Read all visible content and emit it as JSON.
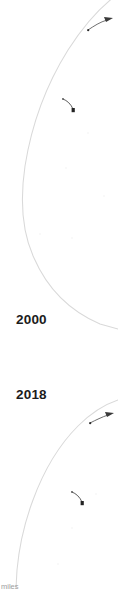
{
  "figure": {
    "kind": "map-panel-strip",
    "background_color": "#ffffff",
    "coastline_color": "#d8d8d8",
    "annotation_color": "#2b2b2b",
    "label_color": "#1c1c1c"
  },
  "panels": [
    {
      "year_label": "2000",
      "curve_name": "shoreline-arc-2000",
      "annotations": [
        {
          "name": "annotation-mark-upper-right",
          "label": ""
        },
        {
          "name": "annotation-mark-mid",
          "label": ""
        }
      ]
    },
    {
      "year_label": "2018",
      "curve_name": "shoreline-arc-2018",
      "annotations": [
        {
          "name": "annotation-mark-upper-right",
          "label": ""
        },
        {
          "name": "annotation-mark-mid",
          "label": ""
        }
      ]
    }
  ],
  "caption": {
    "clipped_text": "miles"
  }
}
